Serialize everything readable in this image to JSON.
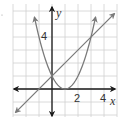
{
  "chart_data": {
    "type": "line",
    "title": "",
    "xlabel": "x",
    "ylabel": "y",
    "xlim": [
      -3,
      5
    ],
    "ylim": [
      -2,
      6.5
    ],
    "grid": true,
    "x_tick_labels": [
      {
        "value": 2,
        "label": "2"
      },
      {
        "value": 4,
        "label": "4"
      }
    ],
    "y_tick_labels": [
      {
        "value": 4,
        "label": "4"
      }
    ],
    "series": [
      {
        "name": "parabola",
        "equation": "y = (x - 1)^2",
        "x": [
          -1.35,
          -1,
          0,
          1,
          2,
          3,
          3.35
        ],
        "y": [
          5.52,
          4,
          1,
          0,
          1,
          4,
          5.52
        ],
        "arrows": "both"
      },
      {
        "name": "line",
        "equation": "y = x + 1",
        "x": [
          -2.8,
          -1,
          0,
          1,
          2,
          3,
          4.8
        ],
        "y": [
          -1.8,
          0,
          1,
          2,
          3,
          4,
          5.8
        ],
        "arrows": "both"
      }
    ],
    "intersections": [
      {
        "x": 0,
        "y": 1
      },
      {
        "x": 3,
        "y": 4
      }
    ],
    "colors": {
      "axes": "#1a1a1a",
      "curves": "#7a7a7a",
      "grid": "#d0d0d0"
    }
  },
  "labels": {
    "x_axis": "x",
    "y_axis": "y",
    "x_tick_2": "2",
    "x_tick_4": "4",
    "y_tick_4": "4"
  }
}
